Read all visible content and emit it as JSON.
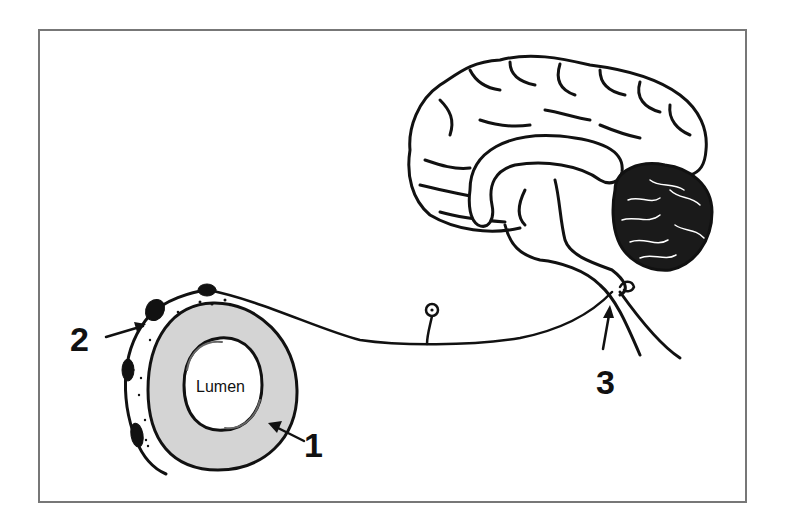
{
  "diagram": {
    "type": "anatomical-schematic",
    "labels": {
      "lumen": "Lumen",
      "marker_1": "1",
      "marker_2": "2",
      "marker_3": "3"
    },
    "components": [
      {
        "id": "vessel-wall",
        "label": "1",
        "description": "gray shaded vessel wall ring around lumen"
      },
      {
        "id": "perivascular-nerve",
        "label": "2",
        "description": "nerve fiber with dark varicosities wrapping the vessel"
      },
      {
        "id": "brainstem-junction",
        "label": "3",
        "description": "axon entering brainstem"
      },
      {
        "id": "neuron-cell-body",
        "label": "",
        "description": "small ganglion cell body with nucleus on axon"
      },
      {
        "id": "brain",
        "label": "",
        "description": "midsagittal brain with cerebrum, corpus callosum, cerebellum, brainstem"
      }
    ],
    "colors": {
      "stroke": "#111111",
      "vessel_fill": "#d4d4d4",
      "frame": "#777777",
      "background": "#ffffff"
    }
  }
}
